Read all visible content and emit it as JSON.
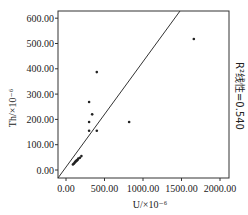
{
  "chart_data": {
    "type": "scatter",
    "title": "",
    "xlabel": "U/×10⁻⁶",
    "ylabel": "Th/×10⁻⁶",
    "xlim": [
      -100,
      2100
    ],
    "ylim": [
      -30,
      630
    ],
    "x_ticks": [
      "0.00",
      "500.00",
      "1000.00",
      "1500.00",
      "2000.00"
    ],
    "x_tick_values": [
      0,
      500,
      1000,
      1500,
      2000
    ],
    "y_ticks": [
      "0.00",
      "100.00",
      "200.00",
      "300.00",
      "400.00",
      "500.00",
      "600.00"
    ],
    "y_tick_values": [
      0,
      100,
      200,
      300,
      400,
      500,
      600
    ],
    "grid": false,
    "annotation": "R²线性=0.540",
    "r_squared": 0.54,
    "fit_line": {
      "x": [
        -100,
        1480
      ],
      "y": [
        -30,
        630
      ]
    },
    "points": [
      {
        "x": 1660,
        "y": 518
      },
      {
        "x": 400,
        "y": 387
      },
      {
        "x": 300,
        "y": 269
      },
      {
        "x": 340,
        "y": 220
      },
      {
        "x": 300,
        "y": 190
      },
      {
        "x": 300,
        "y": 155
      },
      {
        "x": 400,
        "y": 155
      },
      {
        "x": 820,
        "y": 190
      },
      {
        "x": 200,
        "y": 55
      },
      {
        "x": 180,
        "y": 48
      },
      {
        "x": 160,
        "y": 45
      },
      {
        "x": 150,
        "y": 40
      },
      {
        "x": 140,
        "y": 38
      },
      {
        "x": 130,
        "y": 35
      },
      {
        "x": 120,
        "y": 32
      },
      {
        "x": 110,
        "y": 28
      },
      {
        "x": 100,
        "y": 25
      },
      {
        "x": 90,
        "y": 22
      }
    ]
  },
  "labels": {
    "xlabel": "U/×10⁻⁶",
    "ylabel": "Th/×10⁻⁶",
    "annotation": "R²线性=0.540"
  }
}
